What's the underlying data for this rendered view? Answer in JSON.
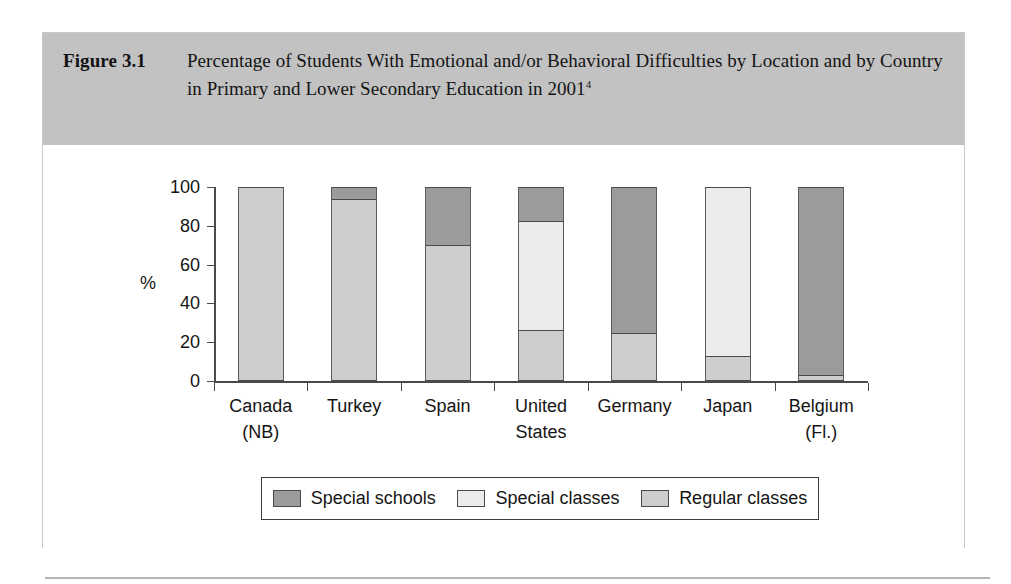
{
  "figure": {
    "label": "Figure 3.1",
    "title": "Percentage of Students With Emotional and/or Behavioral Difficulties by Location and by Country in Primary and Lower Secondary Education in 2001",
    "title_footnote": "4"
  },
  "chart_data": {
    "type": "bar",
    "subtype": "stacked-100-percent",
    "title": "Percentage of Students With Emotional and/or Behavioral Difficulties by Location and by Country in Primary and Lower Secondary Education in 2001",
    "xlabel": "",
    "ylabel": "%",
    "ylim": [
      0,
      100
    ],
    "yticks": [
      0,
      20,
      40,
      60,
      80,
      100
    ],
    "ytick_labels": [
      "0",
      "20",
      "40",
      "60",
      "80",
      "100"
    ],
    "grid": false,
    "legend_position": "bottom",
    "categories": [
      "Canada\n(NB)",
      "Turkey",
      "Spain",
      "United\nStates",
      "Germany",
      "Japan",
      "Belgium\n(Fl.)"
    ],
    "category_lines": [
      [
        "Canada",
        "(NB)"
      ],
      [
        "Turkey",
        ""
      ],
      [
        "Spain",
        ""
      ],
      [
        "United",
        "States"
      ],
      [
        "Germany",
        ""
      ],
      [
        "Japan",
        ""
      ],
      [
        "Belgium",
        "(Fl.)"
      ]
    ],
    "series": [
      {
        "name": "Special schools",
        "color": "#9b9b9b",
        "values": [
          0,
          6,
          30,
          17.5,
          75,
          0,
          97
        ]
      },
      {
        "name": "Special classes",
        "color": "#ececec",
        "values": [
          0,
          0,
          0,
          56,
          0,
          87,
          0
        ]
      },
      {
        "name": "Regular classes",
        "color": "#cdcdcd",
        "values": [
          100,
          94,
          70,
          26.5,
          25,
          13,
          3
        ]
      }
    ],
    "stack_order_top_to_bottom": [
      "Special schools",
      "Special classes",
      "Regular classes"
    ]
  },
  "legend": {
    "items": [
      {
        "label": "Special schools",
        "color": "#9b9b9b"
      },
      {
        "label": "Special classes",
        "color": "#ececec"
      },
      {
        "label": "Regular classes",
        "color": "#cdcdcd"
      }
    ]
  },
  "colors": {
    "header_band": "#c2c2c2",
    "axis": "#4a4a4a",
    "panel_background": "#ffffff"
  }
}
